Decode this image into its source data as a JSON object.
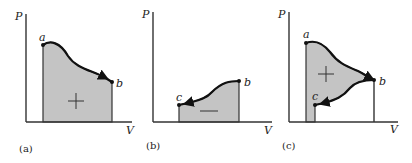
{
  "panels": [
    {
      "id": "a",
      "caption": "(a)",
      "y_axis_label": "P",
      "x_axis_label": "V",
      "points": [
        {
          "label": "a"
        },
        {
          "label": "b"
        }
      ],
      "area_sign": "+",
      "process": "expansion a to b, positive work"
    },
    {
      "id": "b",
      "caption": "(b)",
      "y_axis_label": "P",
      "x_axis_label": "V",
      "points": [
        {
          "label": "c"
        },
        {
          "label": "b"
        }
      ],
      "area_sign": "—",
      "process": "compression b to c, negative work"
    },
    {
      "id": "c",
      "caption": "(c)",
      "y_axis_label": "P",
      "x_axis_label": "V",
      "points": [
        {
          "label": "a"
        },
        {
          "label": "b"
        },
        {
          "label": "c"
        }
      ],
      "area_sign": "+",
      "process": "a to b to c, net positive work"
    }
  ],
  "colors": {
    "shaded_area": "#c4c4c4",
    "curve": "#111111",
    "axis": "#333333"
  }
}
